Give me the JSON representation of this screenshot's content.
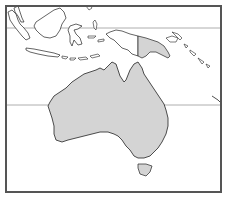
{
  "map": {
    "region": "Australia and Oceania",
    "highlighted": [
      "Australia",
      "Papua New Guinea"
    ],
    "context_land": [
      "Indonesia",
      "Malaysia",
      "Philippines",
      "East Timor",
      "Solomon Islands",
      "New Zealand"
    ],
    "reference_lines": [
      {
        "name": "equator",
        "y": 28
      },
      {
        "name": "tropic-of-capricorn",
        "y": 105
      }
    ],
    "colors": {
      "background": "#ffffff",
      "highlight_fill": "#d4d4d4",
      "outline": "#222222",
      "context_fill": "#ffffff",
      "reference_line": "#999999",
      "frame": "#555555"
    }
  }
}
